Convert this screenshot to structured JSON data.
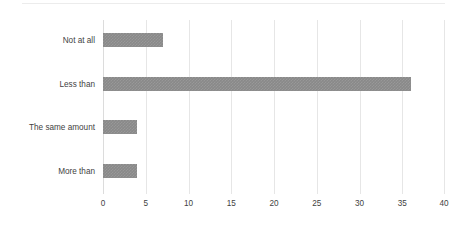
{
  "chart_data": {
    "type": "bar",
    "orientation": "horizontal",
    "title": "",
    "subtitle": "",
    "xlabel": "",
    "ylabel": "",
    "categories": [
      "Not at all",
      "Less than",
      "The same amount",
      "More than"
    ],
    "values": [
      7,
      36,
      4,
      4
    ],
    "series": [
      {
        "name": "",
        "values": [
          7,
          36,
          4,
          4
        ]
      }
    ],
    "xlim": [
      0,
      40
    ],
    "xticks": [
      0,
      5,
      10,
      15,
      20,
      25,
      30,
      35,
      40
    ],
    "xticklabels": [
      "0",
      "5",
      "10",
      "15",
      "20",
      "25",
      "30",
      "35",
      "40"
    ],
    "grid": "vertical",
    "legend": "none",
    "annotations": [],
    "colors": {
      "bar_fill": "#898989",
      "gridline": "#e6e6e6",
      "axis": "#dcdcdc",
      "tick_label": "#3f3f3f",
      "background": "#ffffff",
      "top_rule": "#ececec"
    }
  }
}
